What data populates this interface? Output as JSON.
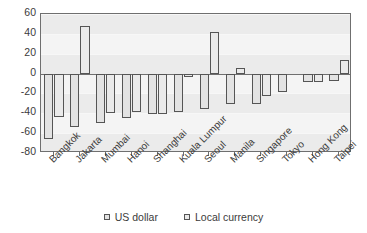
{
  "title_strip": "",
  "legend": {
    "position": "bottom",
    "items": [
      {
        "label": "US dollar",
        "swatch": "square-outline-swatch"
      },
      {
        "label": "Local currency",
        "swatch": "square-outline-swatch"
      }
    ]
  },
  "axis": {
    "yticks": [
      "60",
      "40",
      "20",
      "0",
      "-20",
      "-40",
      "-60",
      "-80"
    ],
    "ylabel": "",
    "xlabel": ""
  },
  "colors": {
    "plot_background": "#ebebeb",
    "band": "#f4f4f4",
    "bar_fill": "#e3e3e3",
    "bar_stroke": "#555555",
    "axis_line": "#6f6f6f",
    "text": "#3b3b3b"
  },
  "chart_data": {
    "type": "bar",
    "title": "",
    "xlabel": "",
    "ylabel": "",
    "ylim": [
      -80,
      60
    ],
    "yticks": [
      -80,
      -60,
      -40,
      -20,
      0,
      20,
      40,
      60
    ],
    "grid": true,
    "legend_position": "bottom",
    "categories": [
      "Bangkok",
      "Jakarta",
      "Mumbai",
      "Hanoi",
      "Shanghai",
      "Kuala Lumpur",
      "Seoul",
      "Manila",
      "Singapore",
      "Tokyo",
      "Hong Kong",
      "Taipei"
    ],
    "series": [
      {
        "name": "US dollar",
        "values": [
          -66,
          -54,
          -50,
          -45,
          -41,
          -39,
          -36,
          -31,
          -31,
          -19,
          -8,
          -7
        ]
      },
      {
        "name": "Local currency",
        "values": [
          -44,
          48,
          -40,
          -39,
          -41,
          -3,
          42,
          6,
          -23,
          0,
          -8,
          14
        ]
      }
    ]
  }
}
